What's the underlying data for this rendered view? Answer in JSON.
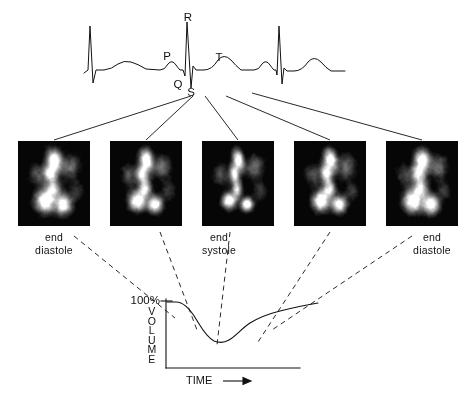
{
  "figure": {
    "ink_color": "#111111",
    "background_color": "#ffffff"
  },
  "ecg": {
    "name": "electrocardiogram-trace",
    "labels": [
      {
        "id": "P",
        "text": "P",
        "x": 167,
        "y": 50
      },
      {
        "id": "Q",
        "text": "Q",
        "x": 178,
        "y": 78
      },
      {
        "id": "R",
        "text": "R",
        "x": 188,
        "y": 11
      },
      {
        "id": "S",
        "text": "S",
        "x": 191,
        "y": 86
      },
      {
        "id": "T",
        "text": "T",
        "x": 219,
        "y": 51
      }
    ]
  },
  "scans": {
    "caption_groups": [
      {
        "id": "end-diastole-left",
        "line1": "end",
        "line2": "diastole",
        "x": 54,
        "y": 231
      },
      {
        "id": "end-systole",
        "line1": "end",
        "line2": "systole",
        "x": 219,
        "y": 231
      },
      {
        "id": "end-diastole-right",
        "line1": "end",
        "line2": "diastole",
        "x": 432,
        "y": 231
      }
    ],
    "frames": [
      {
        "id": "frame-1",
        "phase": "end diastole",
        "x": 18,
        "y": 141,
        "w": 72,
        "h": 85
      },
      {
        "id": "frame-2",
        "phase": "ejection",
        "x": 110,
        "y": 141,
        "w": 72,
        "h": 85
      },
      {
        "id": "frame-3",
        "phase": "end systole",
        "x": 202,
        "y": 141,
        "w": 72,
        "h": 85
      },
      {
        "id": "frame-4",
        "phase": "filling",
        "x": 294,
        "y": 141,
        "w": 72,
        "h": 85
      },
      {
        "id": "frame-5",
        "phase": "end diastole",
        "x": 386,
        "y": 141,
        "w": 72,
        "h": 85
      }
    ]
  },
  "volume_plot": {
    "y_axis_label_letters": [
      "V",
      "O",
      "L",
      "U",
      "M",
      "E"
    ],
    "y_axis_label": "VOLUME",
    "y_tick_label": "100%",
    "x_axis_label": "TIME",
    "x_axis_arrow": "→"
  },
  "chart_data": {
    "type": "line",
    "xlabel": "TIME",
    "ylabel": "VOLUME",
    "ylim": [
      0,
      100
    ],
    "y_ticks": [
      100
    ],
    "y_tick_labels": [
      "100%"
    ],
    "grid": false,
    "legend": null,
    "series": [
      {
        "name": "ventricular volume",
        "x": [
          0,
          4,
          10,
          16,
          22,
          28,
          34,
          40,
          46,
          52,
          58,
          64,
          70,
          76,
          82,
          88,
          94,
          100
        ],
        "y": [
          100,
          100,
          98,
          91,
          78,
          64,
          54,
          48,
          46,
          46,
          49,
          57,
          67,
          75,
          80,
          84,
          88,
          92
        ]
      }
    ],
    "annotations": [
      {
        "text": "end diastole",
        "x": 0,
        "y": 100
      },
      {
        "text": "end systole",
        "x": 46,
        "y": 46
      },
      {
        "text": "end diastole",
        "x": 100,
        "y": 92
      }
    ]
  }
}
